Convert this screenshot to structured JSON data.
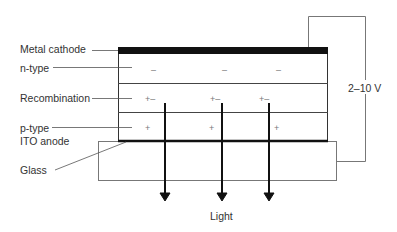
{
  "diagram": {
    "labels": {
      "metal_cathode": "Metal cathode",
      "n_type": "n-type",
      "recombination": "Recombination",
      "p_type": "p-type",
      "ito_anode": "ITO anode",
      "glass": "Glass",
      "voltage": "2–10 V",
      "light": "Light"
    },
    "layers": [
      {
        "name": "Metal cathode"
      },
      {
        "name": "n-type",
        "symbols": [
          "–",
          "–",
          "–"
        ]
      },
      {
        "name": "Recombination",
        "symbols": [
          "+–",
          "+–",
          "+–"
        ]
      },
      {
        "name": "p-type",
        "symbols": [
          "+",
          "+",
          "+"
        ]
      },
      {
        "name": "ITO anode"
      },
      {
        "name": "Glass"
      }
    ],
    "light_arrows": 3,
    "colors": {
      "line": "#222222",
      "thin_line": "#666666",
      "background": "#ffffff"
    }
  }
}
